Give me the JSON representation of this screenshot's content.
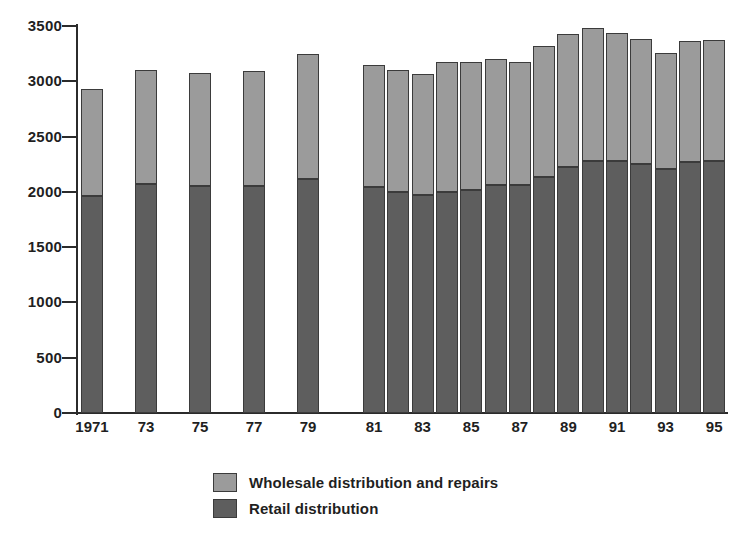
{
  "chart_data": {
    "type": "bar",
    "subtype": "stacked-vertical",
    "title": "",
    "subtitle": "",
    "xlabel": "",
    "ylabel": "",
    "ylim": [
      0,
      3500
    ],
    "ytick_values": [
      0,
      500,
      1000,
      1500,
      2000,
      2500,
      3000,
      3500
    ],
    "ytick_labels": [
      "0",
      "500",
      "1000",
      "1500",
      "2000",
      "2500",
      "3000",
      "3500"
    ],
    "grid": false,
    "legend_position": "bottom-center",
    "categories": [
      "1971",
      "1973",
      "1975",
      "1977",
      "1979",
      "1981",
      "1982",
      "1983",
      "1984",
      "1985",
      "1986",
      "1987",
      "1988",
      "1989",
      "1990",
      "1991",
      "1992",
      "1993",
      "1994",
      "1995"
    ],
    "xtick_labels": [
      "1971",
      "73",
      "75",
      "77",
      "79",
      "81",
      "",
      "83",
      "",
      "85",
      "",
      "87",
      "",
      "89",
      "",
      "91",
      "",
      "93",
      "",
      "95"
    ],
    "series": [
      {
        "name": "Retail distribution",
        "color": "#5e5e5e",
        "values": [
          1960,
          2070,
          2050,
          2050,
          2120,
          2040,
          2000,
          1975,
          2000,
          2020,
          2060,
          2060,
          2130,
          2225,
          2280,
          2280,
          2255,
          2205,
          2270,
          2280
        ]
      },
      {
        "name": "Wholesale distribution and repairs",
        "color": "#9b9b9b",
        "values": [
          970,
          1030,
          1025,
          1040,
          1125,
          1110,
          1105,
          1095,
          1170,
          1150,
          1140,
          1115,
          1185,
          1200,
          1205,
          1155,
          1125,
          1055,
          1090,
          1090
        ]
      }
    ],
    "totals": [
      2930,
      3100,
      3075,
      3090,
      3245,
      3150,
      3105,
      3070,
      3170,
      3170,
      3200,
      3175,
      3315,
      3425,
      3485,
      3435,
      3380,
      3260,
      3360,
      3370
    ],
    "annotations": []
  },
  "legend": {
    "items": [
      {
        "label": "Wholesale distribution and repairs",
        "color": "#9b9b9b"
      },
      {
        "label": "Retail distribution",
        "color": "#5e5e5e"
      }
    ]
  },
  "colors": {
    "wholesale": "#9b9b9b",
    "retail": "#5e5e5e",
    "axis": "#2b2b2b",
    "text": "#1f1f1f",
    "background": "#ffffff"
  }
}
